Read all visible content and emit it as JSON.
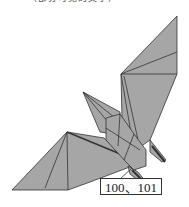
{
  "header": {
    "cut_text": "（部分可见的文字）"
  },
  "figure": {
    "fill_color": "#a6a6a6",
    "line_color": "#333333",
    "step_label": "100、101"
  }
}
